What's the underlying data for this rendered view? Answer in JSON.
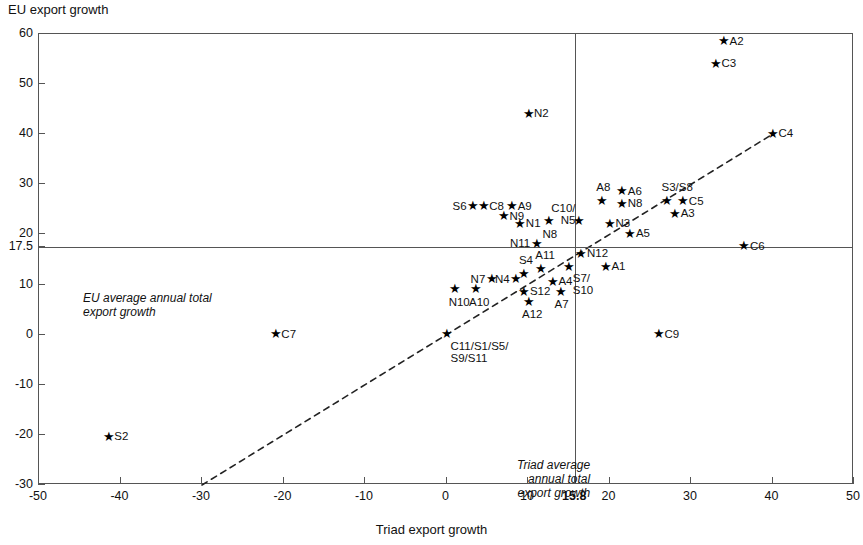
{
  "chart_data": {
    "type": "scatter",
    "title": "",
    "ylabel": "EU export growth",
    "xlabel": "Triad export growth",
    "xlim": [
      -50,
      50
    ],
    "ylim": [
      -30,
      60
    ],
    "xticks": [
      "-50",
      "-40",
      "-30",
      "-20",
      "-10",
      "0",
      "10",
      "15.8",
      "20",
      "30",
      "40",
      "50"
    ],
    "xtick_values": [
      -50,
      -40,
      -30,
      -20,
      -10,
      0,
      10,
      15.8,
      20,
      30,
      40,
      50
    ],
    "yticks": [
      "60",
      "50",
      "40",
      "30",
      "20",
      "17.5",
      "10",
      "0",
      "-10",
      "-20",
      "-30"
    ],
    "ytick_values": [
      60,
      50,
      40,
      30,
      20,
      17.5,
      10,
      0,
      -10,
      -20,
      -30
    ],
    "grid": false,
    "legend": null,
    "reference_lines": [
      {
        "name": "eu-average-line",
        "orientation": "horizontal",
        "value": 17.5,
        "label": "EU average annual total\nexport growth"
      },
      {
        "name": "triad-average-line",
        "orientation": "vertical",
        "value": 15.8,
        "label": "Triad average\nannual total\nexport growth"
      }
    ],
    "trendline": {
      "type": "dashed-diagonal",
      "x1": -30,
      "y1": -30,
      "x2": 40,
      "y2": 40
    },
    "points": [
      {
        "label": "A2",
        "x": 34.0,
        "y": 58.5,
        "pos": "r"
      },
      {
        "label": "C3",
        "x": 33.0,
        "y": 54.0,
        "pos": "r"
      },
      {
        "label": "C4",
        "x": 40.0,
        "y": 40.0,
        "pos": "r"
      },
      {
        "label": "N2",
        "x": 10.0,
        "y": 44.0,
        "pos": "r"
      },
      {
        "label": "A6",
        "x": 21.5,
        "y": 28.5,
        "pos": "r"
      },
      {
        "label": "S3/S8",
        "x": 27.0,
        "y": 26.5,
        "pos": "t"
      },
      {
        "label": "C5",
        "x": 29.0,
        "y": 26.5,
        "pos": "r"
      },
      {
        "label": "A8",
        "x": 19.0,
        "y": 26.5,
        "pos": "t"
      },
      {
        "label": "N8",
        "x": 21.5,
        "y": 26.0,
        "pos": "r"
      },
      {
        "label": "A3",
        "x": 28.0,
        "y": 24.0,
        "pos": "r"
      },
      {
        "label": "A9",
        "x": 8.0,
        "y": 25.5,
        "pos": "r"
      },
      {
        "label": "C8",
        "x": 4.5,
        "y": 25.5,
        "pos": "r"
      },
      {
        "label": "S6",
        "x": 3.2,
        "y": 25.5,
        "pos": "l"
      },
      {
        "label": "N9",
        "x": 7.0,
        "y": 23.5,
        "pos": "r"
      },
      {
        "label": "N1",
        "x": 9.0,
        "y": 22.0,
        "pos": "r"
      },
      {
        "label": "N8 ",
        "x": 12.5,
        "y": 22.5,
        "pos": "b"
      },
      {
        "label": "C10/\nN5",
        "x": 16.2,
        "y": 22.5,
        "pos": "tl"
      },
      {
        "label": "N3",
        "x": 20.0,
        "y": 22.0,
        "pos": "r"
      },
      {
        "label": "A5",
        "x": 22.5,
        "y": 20.0,
        "pos": "r"
      },
      {
        "label": "N11",
        "x": 11.0,
        "y": 18.0,
        "pos": "l"
      },
      {
        "label": "C6",
        "x": 36.5,
        "y": 17.5,
        "pos": "r"
      },
      {
        "label": "N12",
        "x": 16.5,
        "y": 16.0,
        "pos": "r"
      },
      {
        "label": "A11",
        "x": 11.5,
        "y": 13.0,
        "pos": "t"
      },
      {
        "label": "S7/\nS10",
        "x": 15.0,
        "y": 13.5,
        "pos": "br"
      },
      {
        "label": "A1",
        "x": 19.5,
        "y": 13.5,
        "pos": "r"
      },
      {
        "label": "S4",
        "x": 9.5,
        "y": 12.0,
        "pos": "t"
      },
      {
        "label": "N4",
        "x": 8.5,
        "y": 11.0,
        "pos": "l"
      },
      {
        "label": "N7",
        "x": 5.5,
        "y": 11.0,
        "pos": "l"
      },
      {
        "label": "A4",
        "x": 13.0,
        "y": 10.5,
        "pos": "r"
      },
      {
        "label": "A10",
        "x": 3.5,
        "y": 9.0,
        "pos": "b"
      },
      {
        "label": "N10",
        "x": 1.0,
        "y": 9.0,
        "pos": "b"
      },
      {
        "label": "S12",
        "x": 9.5,
        "y": 8.5,
        "pos": "r"
      },
      {
        "label": "A7",
        "x": 14.0,
        "y": 8.5,
        "pos": "b"
      },
      {
        "label": "A12",
        "x": 10.0,
        "y": 6.5,
        "pos": "b"
      },
      {
        "label": "C11/S1/S5/\nS9/S11",
        "x": 0.0,
        "y": 0.0,
        "pos": "br"
      },
      {
        "label": "C7",
        "x": -21.0,
        "y": 0.0,
        "pos": "r"
      },
      {
        "label": "C9",
        "x": 26.0,
        "y": 0.0,
        "pos": "r"
      },
      {
        "label": "S2",
        "x": -41.5,
        "y": -20.5,
        "pos": "r"
      }
    ]
  }
}
